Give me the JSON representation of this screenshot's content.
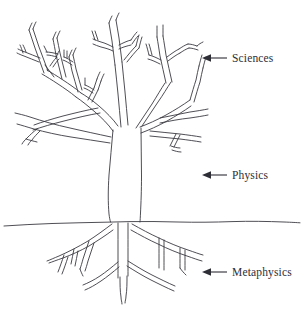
{
  "figure": {
    "background_color": "#ffffff",
    "ink_color": "#3a3a42",
    "width": 302,
    "height": 309
  },
  "annotations": [
    {
      "id": "sciences",
      "label": "Sciences",
      "arrow": "left-arrow",
      "points_to": "branches-canopy"
    },
    {
      "id": "physics",
      "label": "Physics",
      "arrow": "left-arrow",
      "points_to": "trunk"
    },
    {
      "id": "metaphysics",
      "label": "Metaphysics",
      "arrow": "left-arrow",
      "points_to": "roots"
    }
  ],
  "tree": {
    "parts": {
      "canopy": "branches",
      "trunk": "trunk",
      "ground": "ground-line",
      "roots": "roots"
    }
  }
}
